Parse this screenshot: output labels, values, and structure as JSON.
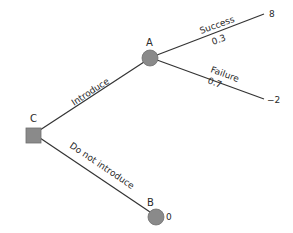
{
  "diagram": {
    "type": "decision-tree",
    "colors": {
      "node_fill": "#8a8a8a",
      "line": "#333333",
      "text": "#2a2a2a",
      "background": "#ffffff"
    },
    "nodes": {
      "C": {
        "label": "C",
        "kind": "decision",
        "shape": "square"
      },
      "A": {
        "label": "A",
        "kind": "chance",
        "shape": "circle"
      },
      "B": {
        "label": "B",
        "kind": "chance",
        "shape": "circle",
        "payoff": "0"
      }
    },
    "edges": {
      "introduce": {
        "label": "Introduce",
        "from": "C",
        "to": "A"
      },
      "do_not_introduce": {
        "label": "Do not introduce",
        "from": "C",
        "to": "B"
      },
      "success": {
        "label": "Success",
        "probability": "0.3",
        "from": "A",
        "payoff": "8"
      },
      "failure": {
        "label": "Failure",
        "probability": "0.7",
        "from": "A",
        "payoff": "−2"
      }
    }
  }
}
